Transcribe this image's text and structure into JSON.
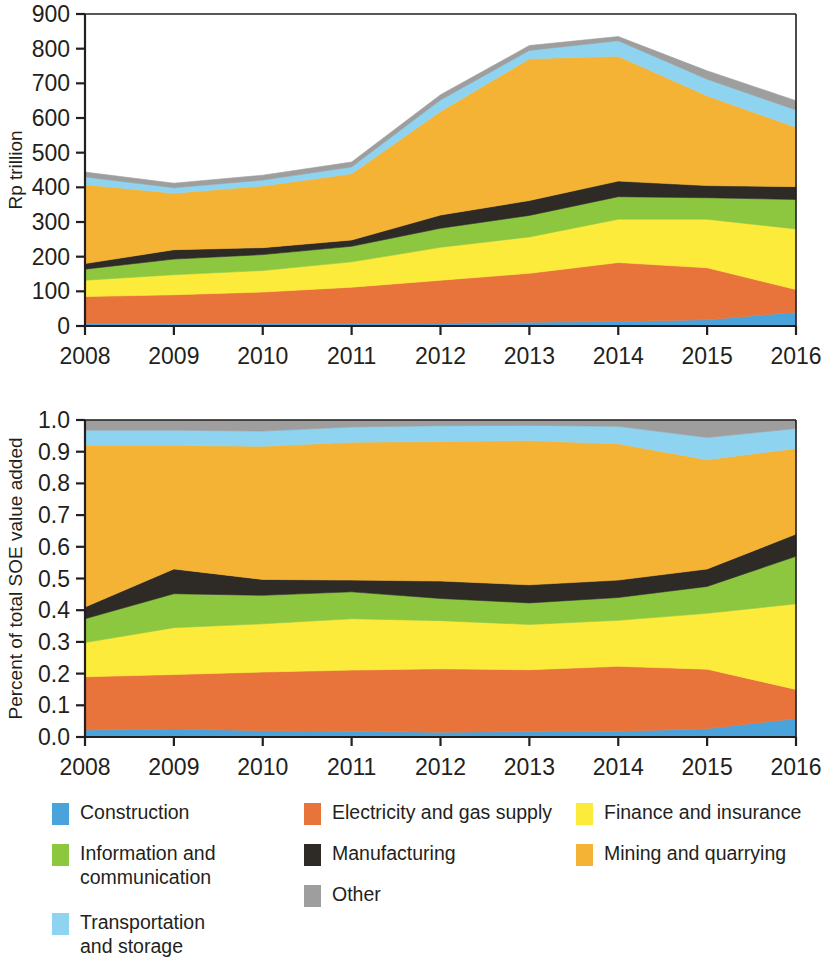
{
  "figure": {
    "title": "",
    "series_names": [
      "Construction",
      "Electricity and gas supply",
      "Finance and insurance",
      "Information and communication",
      "Manufacturing",
      "Mining and quarrying",
      "Transportation and storage",
      "Other"
    ]
  },
  "legend": {
    "position": "bottom",
    "columns": [
      [
        {
          "label": "Construction",
          "color": "#4BA3DC",
          "icon": "legend-swatch-construction"
        },
        {
          "label": "Information and\ncommunication",
          "color": "#8DC63F",
          "icon": "legend-swatch-information-and-communication"
        },
        {
          "label": "Transportation\nand storage",
          "color": "#8ED3F0",
          "icon": "legend-swatch-transportation-and-storage"
        }
      ],
      [
        {
          "label": "Electricity and gas supply",
          "color": "#E8743B",
          "icon": "legend-swatch-electricity-and-gas-supply"
        },
        {
          "label": "Manufacturing",
          "color": "#2E2A26",
          "icon": "legend-swatch-manufacturing"
        },
        {
          "label": "Other",
          "color": "#9E9E9E",
          "icon": "legend-swatch-other"
        }
      ],
      [
        {
          "label": "Finance and insurance",
          "color": "#FDEB3C",
          "icon": "legend-swatch-finance-and-insurance"
        },
        {
          "label": "Mining and quarrying",
          "color": "#F5B335",
          "icon": "legend-swatch-mining-and-quarrying"
        }
      ]
    ]
  },
  "colors": {
    "construction": "#4BA3DC",
    "electricity_and_gas_supply": "#E8743B",
    "finance_and_insurance": "#FDEB3C",
    "information_and_communication": "#8DC63F",
    "manufacturing": "#2E2A26",
    "mining_and_quarrying": "#F5B335",
    "transportation_and_storage": "#8ED3F0",
    "other": "#9E9E9E",
    "axis": "#231f20",
    "background": "#ffffff"
  },
  "chart_data": [
    {
      "id": "top",
      "type": "area",
      "stacked": true,
      "title": "",
      "xlabel": "",
      "ylabel": "Rp trillion",
      "x": [
        2008,
        2009,
        2010,
        2011,
        2012,
        2013,
        2014,
        2015,
        2016
      ],
      "xticklabels": [
        "2008",
        "2009",
        "2010",
        "2011",
        "2012",
        "2013",
        "2014",
        "2015",
        "2016"
      ],
      "xlim": [
        2008,
        2016
      ],
      "ylim": [
        0,
        900
      ],
      "yticks": [
        0,
        100,
        200,
        300,
        400,
        500,
        600,
        700,
        800,
        900
      ],
      "yticklabels": [
        "0",
        "100",
        "200",
        "300",
        "400",
        "500",
        "600",
        "700",
        "800",
        "900"
      ],
      "grid": false,
      "series": [
        {
          "name": "Construction",
          "color": "#4BA3DC",
          "values": [
            8,
            8,
            8,
            8,
            9,
            11,
            13,
            18,
            40
          ]
        },
        {
          "name": "Electricity and gas supply",
          "color": "#E8743B",
          "values": [
            77,
            82,
            90,
            104,
            123,
            141,
            170,
            150,
            65
          ]
        },
        {
          "name": "Finance and insurance",
          "color": "#FDEB3C",
          "values": [
            47,
            58,
            62,
            73,
            95,
            105,
            125,
            140,
            175
          ]
        },
        {
          "name": "Information and communication",
          "color": "#8DC63F",
          "values": [
            32,
            45,
            46,
            45,
            55,
            62,
            65,
            62,
            85
          ]
        },
        {
          "name": "Manufacturing",
          "color": "#2E2A26",
          "values": [
            16,
            27,
            20,
            18,
            38,
            43,
            45,
            35,
            37
          ]
        },
        {
          "name": "Mining and quarrying",
          "color": "#F5B335",
          "values": [
            228,
            163,
            178,
            191,
            299,
            409,
            360,
            259,
            171
          ]
        },
        {
          "name": "Transportation and storage",
          "color": "#8ED3F0",
          "values": [
            22,
            16,
            17,
            20,
            33,
            24,
            45,
            48,
            50
          ]
        },
        {
          "name": "Other",
          "color": "#9E9E9E",
          "values": [
            14,
            13,
            14,
            14,
            15,
            14,
            12,
            24,
            27
          ]
        }
      ],
      "totals": [
        444,
        412,
        435,
        473,
        667,
        809,
        835,
        736,
        650
      ]
    },
    {
      "id": "bottom",
      "type": "area",
      "stacked": true,
      "normalized": true,
      "title": "",
      "xlabel": "",
      "ylabel": "Percent of total SOE value added",
      "x": [
        2008,
        2009,
        2010,
        2011,
        2012,
        2013,
        2014,
        2015,
        2016
      ],
      "xticklabels": [
        "2008",
        "2009",
        "2010",
        "2011",
        "2012",
        "2013",
        "2014",
        "2015",
        "2016"
      ],
      "xlim": [
        2008,
        2016
      ],
      "ylim": [
        0,
        1
      ],
      "yticks": [
        0.0,
        0.1,
        0.2,
        0.3,
        0.4,
        0.5,
        0.6,
        0.7,
        0.8,
        0.9,
        1.0
      ],
      "yticklabels": [
        "0.0",
        "0.1",
        "0.2",
        "0.3",
        "0.4",
        "0.5",
        "0.6",
        "0.7",
        "0.8",
        "0.9",
        "1.0"
      ],
      "grid": false,
      "series": [
        {
          "name": "Construction",
          "color": "#4BA3DC",
          "values": [
            0.022,
            0.025,
            0.02,
            0.018,
            0.015,
            0.017,
            0.018,
            0.026,
            0.058
          ]
        },
        {
          "name": "Electricity and gas supply",
          "color": "#E8743B",
          "values": [
            0.168,
            0.172,
            0.185,
            0.193,
            0.2,
            0.195,
            0.205,
            0.188,
            0.092
          ]
        },
        {
          "name": "Finance and insurance",
          "color": "#FDEB3C",
          "values": [
            0.108,
            0.148,
            0.152,
            0.162,
            0.152,
            0.143,
            0.145,
            0.176,
            0.27
          ]
        },
        {
          "name": "Information and communication",
          "color": "#8DC63F",
          "values": [
            0.075,
            0.107,
            0.09,
            0.085,
            0.07,
            0.068,
            0.072,
            0.085,
            0.15
          ]
        },
        {
          "name": "Manufacturing",
          "color": "#2E2A26",
          "values": [
            0.037,
            0.078,
            0.05,
            0.037,
            0.055,
            0.057,
            0.055,
            0.055,
            0.07
          ]
        },
        {
          "name": "Mining and quarrying",
          "color": "#F5B335",
          "values": [
            0.51,
            0.39,
            0.42,
            0.435,
            0.44,
            0.455,
            0.43,
            0.345,
            0.27
          ]
        },
        {
          "name": "Transportation and storage",
          "color": "#8ED3F0",
          "values": [
            0.048,
            0.048,
            0.048,
            0.048,
            0.05,
            0.048,
            0.055,
            0.07,
            0.063
          ]
        },
        {
          "name": "Other",
          "color": "#9E9E9E",
          "values": [
            0.032,
            0.032,
            0.035,
            0.022,
            0.018,
            0.017,
            0.02,
            0.055,
            0.027
          ]
        }
      ]
    }
  ]
}
